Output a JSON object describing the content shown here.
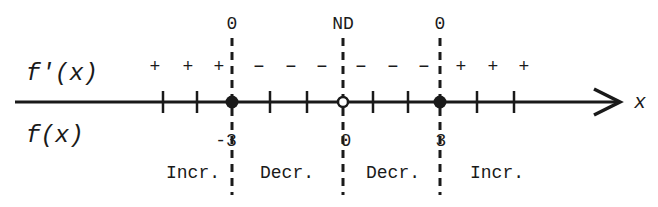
{
  "diagram": {
    "row_labels": {
      "derivative": "f'(x)",
      "function": "f(x)"
    },
    "axis_label": "x",
    "critical_points": [
      {
        "x_value": "-3",
        "derivative_value": "0",
        "point_type": "filled"
      },
      {
        "x_value": "0",
        "derivative_value": "ND",
        "point_type": "open"
      },
      {
        "x_value": "3",
        "derivative_value": "0",
        "point_type": "filled"
      }
    ],
    "intervals": [
      {
        "signs": [
          "+",
          "+",
          "+"
        ],
        "behavior": "Incr."
      },
      {
        "signs": [
          "−",
          "−",
          "−"
        ],
        "behavior": "Decr."
      },
      {
        "signs": [
          "−",
          "−",
          "−"
        ],
        "behavior": "Decr."
      },
      {
        "signs": [
          "+",
          "+",
          "+"
        ],
        "behavior": "Incr."
      }
    ]
  }
}
